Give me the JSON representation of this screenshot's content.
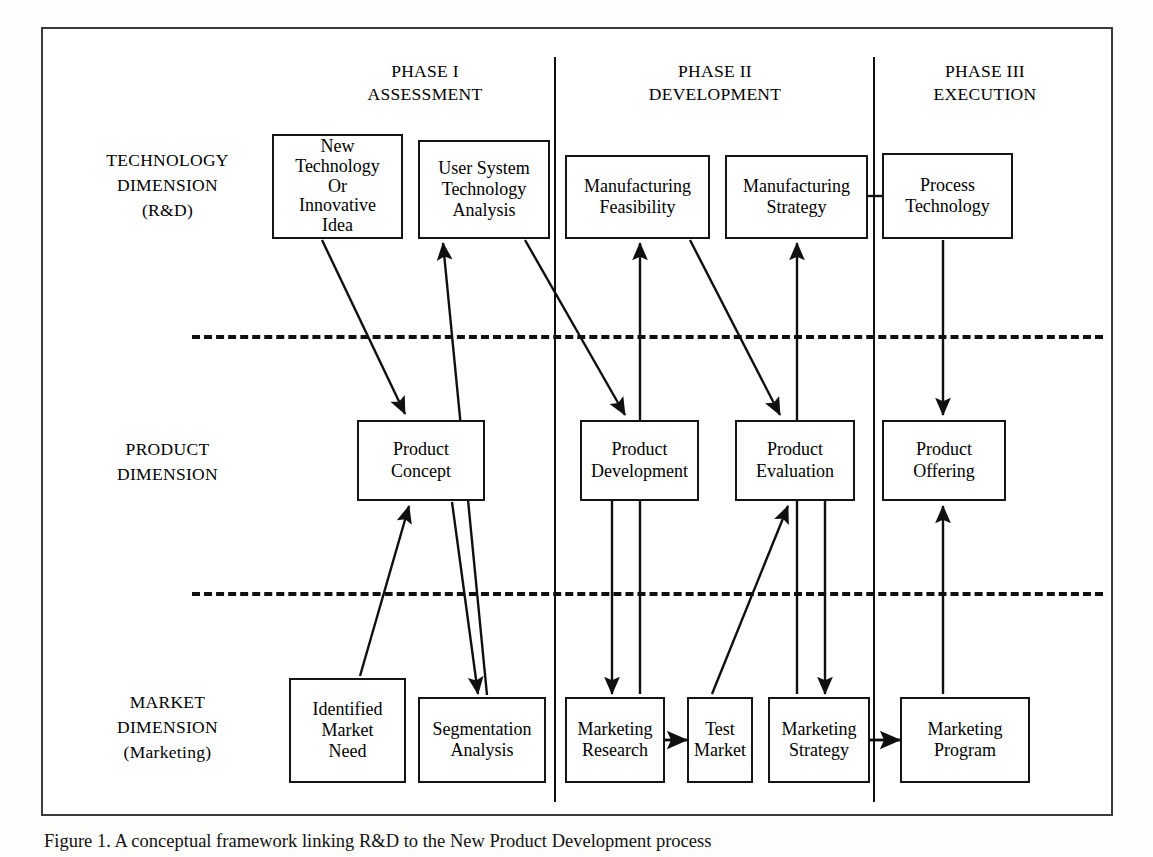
{
  "figure": {
    "caption": "Figure 1. A conceptual framework linking R&D to the New Product Development process",
    "dimension_labels": [
      {
        "id": "technology",
        "text": "TECHNOLOGY\nDIMENSION\n(R&D)"
      },
      {
        "id": "product",
        "text": "PRODUCT\nDIMENSION"
      },
      {
        "id": "market",
        "text": "MARKET\nDIMENSION\n(Marketing)"
      }
    ],
    "phases": [
      {
        "id": "phase-1",
        "text": "PHASE I\nASSESSMENT"
      },
      {
        "id": "phase-2",
        "text": "PHASE II\nDEVELOPMENT"
      },
      {
        "id": "phase-3",
        "text": "PHASE III\nEXECUTION"
      }
    ],
    "nodes": [
      {
        "id": "new-technology-or-innovative-idea",
        "label": "New\nTechnology\nOr\nInnovative\nIdea",
        "row": "technology",
        "phase": "phase-1"
      },
      {
        "id": "user-system-technology-analysis",
        "label": "User System\nTechnology\nAnalysis",
        "row": "technology",
        "phase": "phase-1"
      },
      {
        "id": "manufacturing-feasibility",
        "label": "Manufacturing\nFeasibility",
        "row": "technology",
        "phase": "phase-2"
      },
      {
        "id": "manufacturing-strategy",
        "label": "Manufacturing\nStrategy",
        "row": "technology",
        "phase": "phase-2"
      },
      {
        "id": "process-technology",
        "label": "Process\nTechnology",
        "row": "technology",
        "phase": "phase-3"
      },
      {
        "id": "product-concept",
        "label": "Product\nConcept",
        "row": "product",
        "phase": "phase-1"
      },
      {
        "id": "product-development",
        "label": "Product\nDevelopment",
        "row": "product",
        "phase": "phase-2"
      },
      {
        "id": "product-evaluation",
        "label": "Product\nEvaluation",
        "row": "product",
        "phase": "phase-2"
      },
      {
        "id": "product-offering",
        "label": "Product\nOffering",
        "row": "product",
        "phase": "phase-3"
      },
      {
        "id": "identified-market-need",
        "label": "Identified\nMarket\nNeed",
        "row": "market",
        "phase": "phase-1"
      },
      {
        "id": "segmentation-analysis",
        "label": "Segmentation\nAnalysis",
        "row": "market",
        "phase": "phase-1"
      },
      {
        "id": "marketing-research",
        "label": "Marketing\nResearch",
        "row": "market",
        "phase": "phase-2"
      },
      {
        "id": "test-market",
        "label": "Test\nMarket",
        "row": "market",
        "phase": "phase-2"
      },
      {
        "id": "marketing-strategy",
        "label": "Marketing\nStrategy",
        "row": "market",
        "phase": "phase-2"
      },
      {
        "id": "marketing-program",
        "label": "Marketing\nProgram",
        "row": "market",
        "phase": "phase-3"
      }
    ],
    "edges": [
      {
        "from": "new-technology-or-innovative-idea",
        "to": "product-concept"
      },
      {
        "from": "identified-market-need",
        "to": "product-concept"
      },
      {
        "from": "user-system-technology-analysis",
        "to": "product-concept"
      },
      {
        "from": "product-concept",
        "to": "segmentation-analysis"
      },
      {
        "from": "segmentation-analysis",
        "to": "user-system-technology-analysis"
      },
      {
        "from": "user-system-technology-analysis",
        "to": "product-development"
      },
      {
        "from": "marketing-research",
        "to": "product-development"
      },
      {
        "from": "product-development",
        "to": "marketing-research"
      },
      {
        "from": "marketing-research",
        "to": "manufacturing-feasibility"
      },
      {
        "from": "manufacturing-feasibility",
        "to": "product-evaluation"
      },
      {
        "from": "test-market",
        "to": "product-evaluation"
      },
      {
        "from": "marketing-strategy",
        "to": "manufacturing-strategy"
      },
      {
        "from": "product-evaluation",
        "to": "marketing-strategy"
      },
      {
        "from": "marketing-research",
        "to": "test-market"
      },
      {
        "from": "marketing-strategy",
        "to": "marketing-program"
      },
      {
        "from": "process-technology",
        "to": "product-offering"
      },
      {
        "from": "marketing-program",
        "to": "product-offering"
      },
      {
        "from": "manufacturing-strategy",
        "to": "process-technology"
      }
    ],
    "colors": {
      "line": "#101010",
      "box_border": "#151515",
      "frame": "#3a3a3a",
      "background": "#ffffff"
    }
  }
}
